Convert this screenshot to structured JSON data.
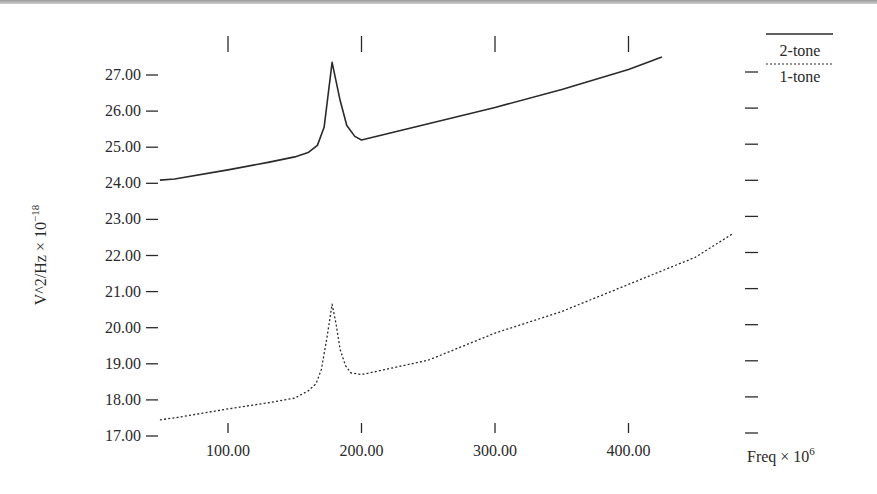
{
  "chart_data": {
    "type": "line",
    "title": "",
    "xlabel": "Freq × 10^6",
    "xlabel_base": "Freq × 10",
    "xlabel_exp": "6",
    "ylabel": "V^2/Hz × 10^-18",
    "ylabel_base": "V^2/Hz × 10",
    "ylabel_exp": "−18",
    "xlim": [
      48,
      480
    ],
    "ylim": [
      17,
      27.5
    ],
    "x_ticks": [
      100,
      200,
      300,
      400
    ],
    "x_tick_labels": [
      "100.00",
      "200.00",
      "300.00",
      "400.00"
    ],
    "y_ticks": [
      17,
      18,
      19,
      20,
      21,
      22,
      23,
      24,
      25,
      26,
      27
    ],
    "y_tick_labels": [
      "17.00",
      "18.00",
      "19.00",
      "20.00",
      "21.00",
      "22.00",
      "23.00",
      "24.00",
      "25.00",
      "26.00",
      "27.00"
    ],
    "grid": false,
    "legend_position": "top-right",
    "series": [
      {
        "name": "2-tone",
        "style": "solid",
        "x": [
          49,
          60,
          100,
          130,
          150,
          160,
          167,
          172,
          178,
          184,
          189,
          195,
          200,
          250,
          300,
          350,
          400,
          425
        ],
        "values": [
          24.09,
          24.12,
          24.37,
          24.58,
          24.73,
          24.85,
          25.05,
          25.55,
          27.35,
          26.3,
          25.6,
          25.3,
          25.2,
          25.65,
          26.1,
          26.6,
          27.15,
          27.5
        ]
      },
      {
        "name": "1-tone",
        "style": "dotted",
        "x": [
          49,
          60,
          100,
          130,
          150,
          160,
          166,
          170,
          174,
          178,
          181,
          184,
          188,
          192,
          200,
          250,
          300,
          350,
          400,
          450,
          478
        ],
        "values": [
          17.45,
          17.5,
          17.75,
          17.92,
          18.05,
          18.25,
          18.45,
          18.85,
          19.7,
          20.65,
          20.1,
          19.4,
          18.95,
          18.75,
          18.7,
          19.1,
          19.85,
          20.45,
          21.2,
          21.95,
          22.6
        ]
      }
    ],
    "colors": {
      "line": "#2a2a2a",
      "text": "#2a2a2a"
    }
  }
}
